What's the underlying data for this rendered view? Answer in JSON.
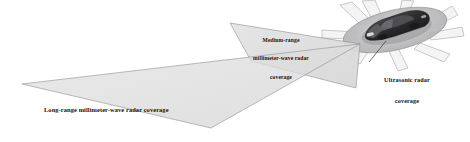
{
  "diagram": {
    "background_color": "#ffffff",
    "labels": {
      "medium_range": {
        "line1": "Medium-range",
        "line2": "millimeter-wave radar",
        "line3": "coverage",
        "full_text": "Medium-range millimeter-wave radar coverage"
      },
      "long_range": {
        "line1": "Long-range millimeter-wave radar coverage",
        "full_text": "Long-range millimeter-wave radar coverage"
      },
      "ultrasonic": {
        "line1": "Ultrasonic radar",
        "line2": "coverage",
        "full_text": "Ultrasonic radar coverage"
      }
    },
    "colors": {
      "coverage_fill": "#dedede",
      "coverage_stroke": "#8a8a8a",
      "ultrasonic_fill": "#f1f1f1",
      "ultrasonic_stroke": "#9a9a9a",
      "car_body_dark": "#2a2a2c",
      "car_body_mid": "#6d6d70",
      "car_glass": "#4a4a4e",
      "ellipse_fill": "#b9b9bb",
      "text": "#15130f",
      "leader_line": "#3a3a3a"
    },
    "shapes": {
      "long_range_cone": {
        "name": "long-range-millimeter-wave-cone",
        "points": "360,44 22,84 210,128"
      },
      "medium_range_cone": {
        "name": "medium-range-millimeter-wave-cone",
        "points": "360,44 230,23 250,60 355,88"
      },
      "ultrasonic_ellipse": {
        "name": "ultrasonic-coverage-ellipse",
        "cx": 395,
        "cy": 30,
        "rx": 53,
        "ry": 20,
        "rotation": -13
      },
      "ultrasonic_beam_count": 8,
      "leader_line": {
        "x1": 386,
        "y1": 41,
        "x2": 369,
        "y2": 62
      }
    }
  }
}
